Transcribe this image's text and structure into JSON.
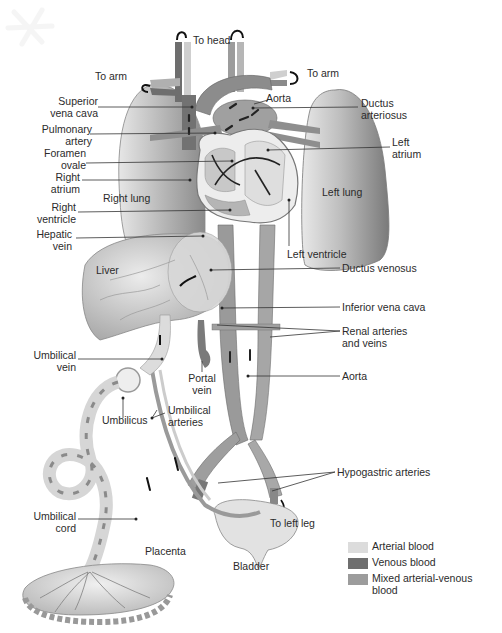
{
  "labels": {
    "to_head": "To head",
    "to_arm_left": "To arm",
    "to_arm_right": "To arm",
    "superior_vena_cava": [
      "Superior",
      "vena cava"
    ],
    "pulmonary_artery": [
      "Pulmonary",
      "artery"
    ],
    "foramen_ovale": [
      "Foramen",
      "ovale"
    ],
    "right_atrium": [
      "Right",
      "atrium"
    ],
    "right_lung": "Right lung",
    "right_ventricle": [
      "Right",
      "ventricle"
    ],
    "hepatic_vein": [
      "Hepatic",
      "vein"
    ],
    "liver": "Liver",
    "aorta_top": "Aorta",
    "ductus_arteriosus": [
      "Ductus",
      "arteriosus"
    ],
    "left_atrium": [
      "Left",
      "atrium"
    ],
    "left_lung": "Left lung",
    "left_ventricle": "Left ventricle",
    "ductus_venosus": "Ductus venosus",
    "inferior_vena_cava": "Inferior vena cava",
    "renal_arteries_veins": [
      "Renal arteries",
      "and veins"
    ],
    "umbilical_vein": [
      "Umbilical",
      "vein"
    ],
    "portal_vein": [
      "Portal",
      "vein"
    ],
    "aorta_bottom": "Aorta",
    "umbilicus": "Umbilicus",
    "umbilical_arteries": [
      "Umbilical",
      "arteries"
    ],
    "hypogastric_arteries": "Hypogastric arteries",
    "umbilical_cord": [
      "Umbilical",
      "cord"
    ],
    "to_left_leg": "To left leg",
    "placenta": "Placenta",
    "bladder": "Bladder"
  },
  "legend": {
    "items": [
      {
        "label": "Arterial blood",
        "color": "#dcdcdc"
      },
      {
        "label": "Venous blood",
        "color": "#6e6e6e"
      },
      {
        "label": "Mixed arterial-venous",
        "label2": "blood",
        "color": "#9c9c9c"
      }
    ]
  },
  "colors": {
    "arterial": "#dcdcdc",
    "venous": "#6e6e6e",
    "mixed": "#9c9c9c",
    "lung": "#a8a8a8",
    "liver": "#c4c4c4",
    "leader": "#333333"
  }
}
